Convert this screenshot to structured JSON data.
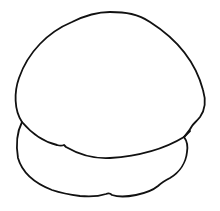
{
  "drawing": {
    "subject": "line drawing of two stacked rounded shapes (dome on top of a flatter base)",
    "background_color": "#ffffff",
    "stroke_color": "#111111",
    "parts": [
      {
        "name": "top-dome",
        "description": "large rounded dome with wavy bottom edge"
      },
      {
        "name": "bottom-base",
        "description": "flatter rounded lower lobe beneath the dome"
      }
    ]
  }
}
